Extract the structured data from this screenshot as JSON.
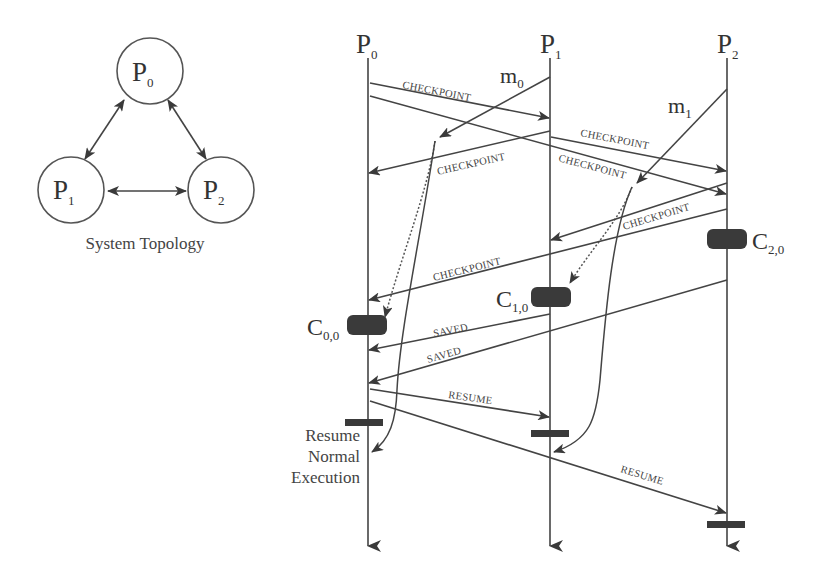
{
  "topology": {
    "caption": "System Topology",
    "nodes": [
      {
        "id": "P0",
        "base": "P",
        "sub": "0"
      },
      {
        "id": "P1",
        "base": "P",
        "sub": "1"
      },
      {
        "id": "P2",
        "base": "P",
        "sub": "2"
      }
    ],
    "links": [
      [
        "P0",
        "P1"
      ],
      [
        "P0",
        "P2"
      ],
      [
        "P1",
        "P2"
      ]
    ]
  },
  "sequence": {
    "processes": [
      {
        "id": "P0",
        "base": "P",
        "sub": "0"
      },
      {
        "id": "P1",
        "base": "P",
        "sub": "1"
      },
      {
        "id": "P2",
        "base": "P",
        "sub": "2"
      }
    ],
    "app_messages": [
      {
        "base": "m",
        "sub": "0",
        "from": "P1",
        "to": "P0"
      },
      {
        "base": "m",
        "sub": "1",
        "from": "P2",
        "to": "P1"
      }
    ],
    "control_messages": [
      {
        "label": "CHECKPOINT",
        "from": "P0",
        "to": "P1"
      },
      {
        "label": "CHECKPOINT",
        "from": "P1",
        "to": "P2"
      },
      {
        "label": "CHECKPOINT",
        "from": "P1",
        "to": "P0"
      },
      {
        "label": "CHECKPOINT",
        "from": "P0",
        "to": "P2"
      },
      {
        "label": "CHECKPOINT",
        "from": "P2",
        "to": "P1"
      },
      {
        "label": "CHECKPOINT",
        "from": "P2",
        "to": "P0"
      },
      {
        "label": "SAVED",
        "from": "P1",
        "to": "P0"
      },
      {
        "label": "SAVED",
        "from": "P2",
        "to": "P0"
      },
      {
        "label": "RESUME",
        "from": "P0",
        "to": "P1"
      },
      {
        "label": "RESUME",
        "from": "P0",
        "to": "P2"
      }
    ],
    "checkpoints": [
      {
        "base": "C",
        "sub": "0,0",
        "process": "P0"
      },
      {
        "base": "C",
        "sub": "1,0",
        "process": "P1"
      },
      {
        "base": "C",
        "sub": "2,0",
        "process": "P2"
      }
    ],
    "resume_note": [
      "Resume",
      "Normal",
      "Execution"
    ]
  }
}
